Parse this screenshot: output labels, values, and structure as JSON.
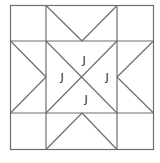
{
  "diagram": {
    "type": "quilt-block",
    "line_color": "#6e6e6e",
    "labels": [
      {
        "text": "J",
        "position": "center-top",
        "x": 84,
        "y": 64
      },
      {
        "text": "J",
        "position": "center-left",
        "x": 62,
        "y": 81
      },
      {
        "text": "J",
        "position": "center-right",
        "x": 107,
        "y": 81
      },
      {
        "text": "J",
        "position": "center-bottom",
        "x": 86,
        "y": 103
      }
    ]
  }
}
